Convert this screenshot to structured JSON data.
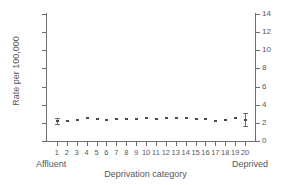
{
  "chart_data": {
    "type": "scatter",
    "title": "",
    "title_truncated": true,
    "xlabel": "Deprivation category",
    "ylabel": "Rate per 100,000",
    "categories": [
      1,
      2,
      3,
      4,
      5,
      6,
      7,
      8,
      9,
      10,
      11,
      12,
      13,
      14,
      15,
      16,
      17,
      18,
      19,
      20
    ],
    "values": [
      2.2,
      2.25,
      2.3,
      2.5,
      2.45,
      2.35,
      2.4,
      2.4,
      2.4,
      2.5,
      2.45,
      2.5,
      2.5,
      2.5,
      2.45,
      2.4,
      2.25,
      2.35,
      2.5,
      2.35
    ],
    "error_low": [
      1.85,
      null,
      null,
      null,
      null,
      null,
      null,
      null,
      null,
      null,
      null,
      null,
      null,
      null,
      null,
      null,
      null,
      null,
      null,
      1.7
    ],
    "error_high": [
      2.55,
      null,
      null,
      null,
      null,
      null,
      null,
      null,
      null,
      null,
      null,
      null,
      null,
      null,
      null,
      null,
      null,
      null,
      null,
      3.1
    ],
    "ylim": [
      0,
      14
    ],
    "xlim": [
      0.5,
      20.5
    ],
    "ytick_values": [
      0,
      2,
      4,
      6,
      8,
      10,
      12,
      14
    ],
    "ytick_labels": [
      "0",
      "2",
      "4",
      "6",
      "8",
      "10",
      "12",
      "14"
    ],
    "ytick_labels_right": [
      "0",
      "2",
      "4",
      "6",
      "8",
      "10",
      "12",
      "14"
    ],
    "xtick_labels": [
      "1",
      "2",
      "3",
      "4",
      "5",
      "6",
      "7",
      "8",
      "9",
      "10",
      "11",
      "12",
      "13",
      "14",
      "15",
      "16",
      "17",
      "18",
      "19",
      "20"
    ],
    "grid": false,
    "legend": false,
    "dual_y_axis": true,
    "annotations": {
      "x_axis_left_anchor": "Affluent",
      "x_axis_right_anchor": "Deprived"
    },
    "marker_color": "#4b4b4d",
    "axis_color": "#6d6e70",
    "text_color": "#58585a",
    "background_color": "#ffffff"
  }
}
